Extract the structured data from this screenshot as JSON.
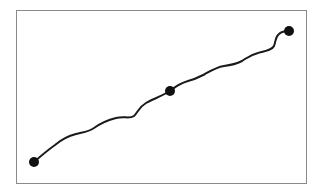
{
  "diagram": {
    "colors": {
      "frame": "#8a8a8a",
      "path": "#1a1a1a",
      "node": "#111111",
      "background": "#ffffff"
    },
    "nodes": [
      {
        "id": "start",
        "label": ""
      },
      {
        "id": "middle",
        "label": ""
      },
      {
        "id": "end",
        "label": ""
      }
    ]
  }
}
